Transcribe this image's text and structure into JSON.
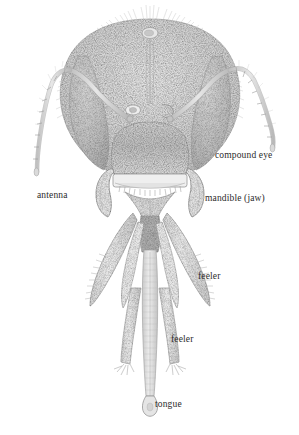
{
  "figure": {
    "kind": "scientific-illustration",
    "style": "stipple engraving, grayscale",
    "background_color": "#ffffff",
    "label_color": "#2b2b2b",
    "ink_color": "#8d8d8d"
  },
  "labels": [
    {
      "id": "antenna",
      "text": "antenna",
      "x": 37,
      "y": 190
    },
    {
      "id": "compound-eye",
      "text": "compound eye",
      "x": 215,
      "y": 150
    },
    {
      "id": "mandible",
      "text": "mandible (jaw)",
      "x": 205,
      "y": 193
    },
    {
      "id": "feeler-upper",
      "text": "feeler",
      "x": 198,
      "y": 271
    },
    {
      "id": "feeler-lower",
      "text": "feeler",
      "x": 171,
      "y": 334
    },
    {
      "id": "tongue",
      "text": "tongue",
      "x": 155,
      "y": 399
    }
  ],
  "anatomy_parts": [
    "median ocellus",
    "lateral ocelli",
    "compound eye (left)",
    "compound eye (right)",
    "antenna scape",
    "antenna flagellum",
    "clypeus",
    "labrum",
    "mandible (left)",
    "mandible (right)",
    "galea",
    "labial palp",
    "glossa (tongue)",
    "flabellum"
  ]
}
